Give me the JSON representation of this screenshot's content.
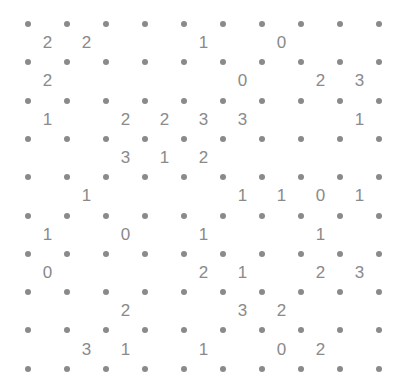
{
  "puzzle": {
    "type": "slitherlink",
    "rows": 9,
    "cols": 9,
    "colors": {
      "dot": "#8a8a8a",
      "clue": "#8a8a8a",
      "background": "#ffffff"
    },
    "clues": [
      [
        "2",
        "2",
        "",
        "",
        "1",
        "",
        "0",
        "",
        ""
      ],
      [
        "2",
        "",
        "",
        "",
        "",
        "0",
        "",
        "2",
        "3"
      ],
      [
        "1",
        "",
        "2",
        "2",
        "3",
        "3",
        "",
        "",
        "1"
      ],
      [
        "",
        "",
        "3",
        "1",
        "2",
        "",
        "",
        "",
        ""
      ],
      [
        "",
        "1",
        "",
        "",
        "",
        "1",
        "1",
        "0",
        "1"
      ],
      [
        "1",
        "",
        "0",
        "",
        "1",
        "",
        "",
        "1",
        ""
      ],
      [
        "0",
        "",
        "",
        "",
        "2",
        "1",
        "",
        "2",
        "3"
      ],
      [
        "",
        "",
        "2",
        "",
        "",
        "3",
        "2",
        "",
        ""
      ],
      [
        "",
        "3",
        "1",
        "",
        "1",
        "",
        "0",
        "2",
        ""
      ]
    ]
  }
}
